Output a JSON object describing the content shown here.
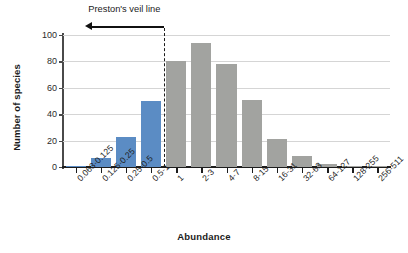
{
  "chart_data": {
    "type": "bar",
    "title": "",
    "subtitle": "",
    "xlabel": "Abundance",
    "ylabel": "Number of species",
    "categories": [
      "0.063-0.125",
      "0.125-0.25",
      "0.25-0.5",
      "0.5-1",
      "1",
      "2-3",
      "4-7",
      "8-15",
      "16-31",
      "32-63",
      "64-127",
      "128-255",
      "256-511"
    ],
    "values": [
      1,
      7,
      23,
      50,
      80,
      94,
      78,
      51,
      21,
      8,
      2,
      1,
      0.5
    ],
    "series": [
      {
        "name": "Number of species",
        "values": [
          1,
          7,
          23,
          50,
          80,
          94,
          78,
          51,
          21,
          8,
          2,
          1,
          0.5
        ]
      }
    ],
    "bar_colors": [
      "#5b8cc4",
      "#5b8cc4",
      "#5b8cc4",
      "#5b8cc4",
      "#a2a3a0",
      "#a2a3a0",
      "#a2a3a0",
      "#a2a3a0",
      "#a2a3a0",
      "#a2a3a0",
      "#a2a3a0",
      "#a2a3a0",
      "#a2a3a0"
    ],
    "ylim": [
      0,
      100
    ],
    "yticks": [
      0,
      20,
      40,
      60,
      80,
      100
    ],
    "ytick_labels": [
      "0",
      "20",
      "40",
      "60",
      "80",
      "100"
    ],
    "grid": "horizontal",
    "legend": "none",
    "annotations": [
      {
        "name": "prestons-veil-line",
        "text": "Preston's veil line",
        "type": "vertical-dashed-line-with-left-arrow",
        "at_category_boundary": "0.5-1 / 1"
      }
    ]
  },
  "colors": {
    "blue": "#5b8cc4",
    "gray": "#a2a3a0",
    "axis": "#1d1d1d",
    "grid": "#d5d5d5",
    "text": "#1b1b1b"
  },
  "veil": {
    "label": "Preston's veil line"
  },
  "axes": {
    "y_title": "Number of species",
    "x_title": "Abundance"
  }
}
